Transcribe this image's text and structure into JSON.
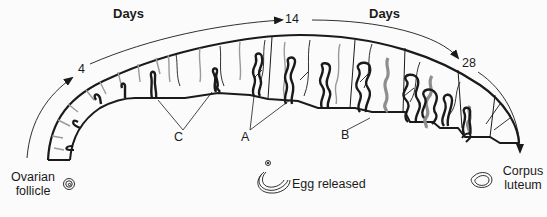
{
  "diagram": {
    "timeline": {
      "axis_label_left": "Days",
      "axis_label_right": "Days",
      "day_markers": [
        "4",
        "14",
        "28"
      ]
    },
    "gland_labels": {
      "a": "A",
      "b": "B",
      "c": "C"
    },
    "ovary_stages": {
      "start": "Ovarian follicle",
      "start_line1": "Ovarian",
      "start_line2": "follicle",
      "middle": "Egg released",
      "end": "Corpus luteum",
      "end_line1": "Corpus",
      "end_line2": "luteum"
    },
    "colors": {
      "ink": "#1a1a1a",
      "gray_gland": "#9a9a9a",
      "background": "#fbfbfb"
    }
  }
}
